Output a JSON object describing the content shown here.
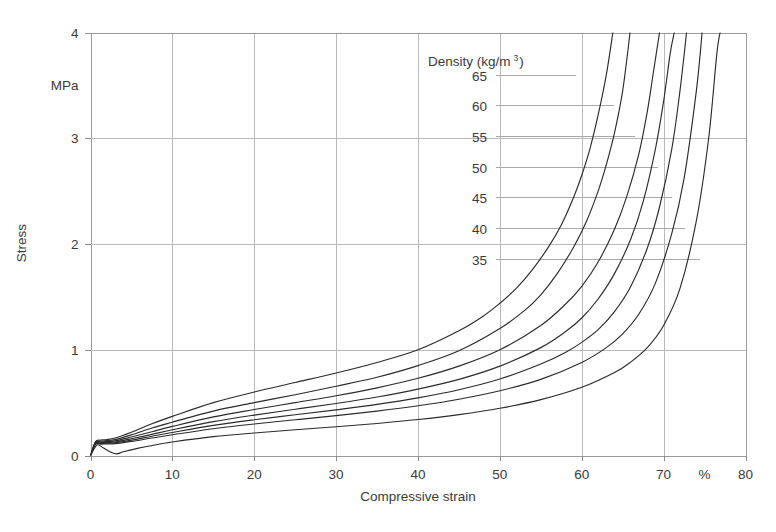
{
  "chart_data": {
    "type": "line",
    "title": "",
    "xlabel": "Compressive strain",
    "xunit": "%",
    "ylabel": "Stress",
    "yunit": "MPa",
    "xlim": [
      0,
      80
    ],
    "ylim": [
      0,
      4
    ],
    "xticks": [
      0,
      10,
      20,
      30,
      40,
      50,
      60,
      70,
      80
    ],
    "xticklabels": [
      "0",
      "10",
      "20",
      "30",
      "40",
      "50",
      "60",
      "70",
      "80"
    ],
    "yticks": [
      0,
      1,
      2,
      3,
      4
    ],
    "yticklabels": [
      "0",
      "1",
      "2",
      "3",
      "4"
    ],
    "grid": true,
    "legend_position": "inside-upper-center",
    "legend_title": "Density (kg/m",
    "legend_title_sup": "3",
    "legend_title_close": ")",
    "series": [
      {
        "name": "65",
        "label": "65",
        "points": [
          [
            0,
            0
          ],
          [
            0.6,
            0.13
          ],
          [
            1.2,
            0.145
          ],
          [
            2,
            0.15
          ],
          [
            3,
            0.165
          ],
          [
            5,
            0.22
          ],
          [
            7.5,
            0.3
          ],
          [
            10,
            0.37
          ],
          [
            15,
            0.5
          ],
          [
            20,
            0.6
          ],
          [
            25,
            0.69
          ],
          [
            30,
            0.78
          ],
          [
            35,
            0.88
          ],
          [
            40,
            1.0
          ],
          [
            45,
            1.18
          ],
          [
            48,
            1.32
          ],
          [
            50,
            1.44
          ],
          [
            52,
            1.58
          ],
          [
            54,
            1.76
          ],
          [
            56,
            1.98
          ],
          [
            57.5,
            2.18
          ],
          [
            59,
            2.44
          ],
          [
            60,
            2.65
          ],
          [
            61,
            2.9
          ],
          [
            62,
            3.22
          ],
          [
            63,
            3.6
          ],
          [
            63.8,
            4.0
          ]
        ]
      },
      {
        "name": "60",
        "label": "60",
        "points": [
          [
            0,
            0
          ],
          [
            0.6,
            0.125
          ],
          [
            1.2,
            0.135
          ],
          [
            2,
            0.14
          ],
          [
            3,
            0.15
          ],
          [
            5,
            0.195
          ],
          [
            7.5,
            0.26
          ],
          [
            10,
            0.315
          ],
          [
            15,
            0.42
          ],
          [
            20,
            0.5
          ],
          [
            25,
            0.575
          ],
          [
            30,
            0.655
          ],
          [
            35,
            0.74
          ],
          [
            40,
            0.85
          ],
          [
            45,
            0.99
          ],
          [
            50,
            1.2
          ],
          [
            53,
            1.37
          ],
          [
            55,
            1.52
          ],
          [
            57,
            1.72
          ],
          [
            59,
            1.97
          ],
          [
            60.5,
            2.2
          ],
          [
            62,
            2.5
          ],
          [
            63,
            2.75
          ],
          [
            64,
            3.05
          ],
          [
            65,
            3.45
          ],
          [
            65.9,
            4.0
          ]
        ]
      },
      {
        "name": "55",
        "label": "55",
        "points": [
          [
            0,
            0
          ],
          [
            0.6,
            0.12
          ],
          [
            1.2,
            0.128
          ],
          [
            2,
            0.132
          ],
          [
            3,
            0.138
          ],
          [
            5,
            0.175
          ],
          [
            7.5,
            0.225
          ],
          [
            10,
            0.275
          ],
          [
            15,
            0.365
          ],
          [
            20,
            0.435
          ],
          [
            25,
            0.5
          ],
          [
            30,
            0.565
          ],
          [
            35,
            0.64
          ],
          [
            40,
            0.73
          ],
          [
            45,
            0.845
          ],
          [
            50,
            1.0
          ],
          [
            55,
            1.23
          ],
          [
            58,
            1.43
          ],
          [
            60,
            1.6
          ],
          [
            62,
            1.83
          ],
          [
            64,
            2.14
          ],
          [
            65.5,
            2.45
          ],
          [
            67,
            2.86
          ],
          [
            68,
            3.25
          ],
          [
            68.8,
            3.65
          ],
          [
            69.5,
            4.0
          ]
        ]
      },
      {
        "name": "50",
        "label": "50",
        "points": [
          [
            0,
            0
          ],
          [
            0.6,
            0.115
          ],
          [
            1.2,
            0.12
          ],
          [
            2,
            0.124
          ],
          [
            3,
            0.128
          ],
          [
            5,
            0.158
          ],
          [
            7.5,
            0.2
          ],
          [
            10,
            0.243
          ],
          [
            15,
            0.32
          ],
          [
            20,
            0.382
          ],
          [
            25,
            0.437
          ],
          [
            30,
            0.492
          ],
          [
            35,
            0.553
          ],
          [
            40,
            0.628
          ],
          [
            45,
            0.72
          ],
          [
            50,
            0.845
          ],
          [
            55,
            1.02
          ],
          [
            58,
            1.17
          ],
          [
            60,
            1.3
          ],
          [
            62,
            1.48
          ],
          [
            64,
            1.72
          ],
          [
            66,
            2.05
          ],
          [
            67.5,
            2.4
          ],
          [
            69,
            2.9
          ],
          [
            70,
            3.35
          ],
          [
            70.8,
            3.8
          ],
          [
            71.3,
            4.0
          ]
        ]
      },
      {
        "name": "45",
        "label": "45",
        "points": [
          [
            0,
            0
          ],
          [
            0.6,
            0.11
          ],
          [
            1.2,
            0.114
          ],
          [
            2,
            0.117
          ],
          [
            3,
            0.12
          ],
          [
            5,
            0.145
          ],
          [
            7.5,
            0.182
          ],
          [
            10,
            0.218
          ],
          [
            15,
            0.285
          ],
          [
            20,
            0.338
          ],
          [
            25,
            0.385
          ],
          [
            30,
            0.432
          ],
          [
            35,
            0.483
          ],
          [
            40,
            0.545
          ],
          [
            45,
            0.622
          ],
          [
            50,
            0.723
          ],
          [
            55,
            0.865
          ],
          [
            58,
            0.975
          ],
          [
            60,
            1.07
          ],
          [
            62,
            1.19
          ],
          [
            64,
            1.36
          ],
          [
            66,
            1.6
          ],
          [
            68,
            1.96
          ],
          [
            69.5,
            2.35
          ],
          [
            71,
            2.9
          ],
          [
            72,
            3.45
          ],
          [
            72.8,
            4.0
          ]
        ]
      },
      {
        "name": "40",
        "label": "40",
        "points": [
          [
            0,
            0
          ],
          [
            0.6,
            0.105
          ],
          [
            1.2,
            0.108
          ],
          [
            2,
            0.11
          ],
          [
            3,
            0.112
          ],
          [
            5,
            0.133
          ],
          [
            7.5,
            0.165
          ],
          [
            10,
            0.196
          ],
          [
            15,
            0.253
          ],
          [
            20,
            0.298
          ],
          [
            25,
            0.338
          ],
          [
            30,
            0.377
          ],
          [
            35,
            0.42
          ],
          [
            40,
            0.47
          ],
          [
            45,
            0.532
          ],
          [
            50,
            0.612
          ],
          [
            55,
            0.72
          ],
          [
            60,
            0.88
          ],
          [
            63,
            1.02
          ],
          [
            65,
            1.15
          ],
          [
            67,
            1.34
          ],
          [
            69,
            1.63
          ],
          [
            71,
            2.1
          ],
          [
            72.5,
            2.62
          ],
          [
            74,
            3.45
          ],
          [
            74.7,
            4.0
          ]
        ]
      },
      {
        "name": "35",
        "label": "35",
        "points": [
          [
            0,
            0
          ],
          [
            0.8,
            0.1
          ],
          [
            1.6,
            0.07
          ],
          [
            2.4,
            0.035
          ],
          [
            3.2,
            0.015
          ],
          [
            4,
            0.035
          ],
          [
            6,
            0.072
          ],
          [
            8,
            0.102
          ],
          [
            10,
            0.128
          ],
          [
            15,
            0.178
          ],
          [
            20,
            0.213
          ],
          [
            25,
            0.243
          ],
          [
            30,
            0.272
          ],
          [
            35,
            0.303
          ],
          [
            40,
            0.34
          ],
          [
            45,
            0.387
          ],
          [
            50,
            0.447
          ],
          [
            55,
            0.528
          ],
          [
            60,
            0.645
          ],
          [
            64,
            0.785
          ],
          [
            66,
            0.885
          ],
          [
            68,
            1.02
          ],
          [
            70,
            1.23
          ],
          [
            72,
            1.58
          ],
          [
            74,
            2.22
          ],
          [
            75.5,
            3.0
          ],
          [
            76.5,
            3.8
          ],
          [
            76.9,
            4.0
          ]
        ]
      }
    ],
    "legend_entries": [
      {
        "label": "65",
        "leader_end_x": 59.3
      },
      {
        "label": "60",
        "leader_end_x": 63.9
      },
      {
        "label": "55",
        "leader_end_x": 66.5
      },
      {
        "label": "50",
        "leader_end_x": 69.3
      },
      {
        "label": "45",
        "leader_end_x": 71.0
      },
      {
        "label": "40",
        "leader_end_x": 72.6
      },
      {
        "label": "35",
        "leader_end_x": 74.4
      }
    ],
    "legend_value_rows_y": [
      3.6,
      3.31,
      3.02,
      2.73,
      2.44,
      2.15,
      1.86
    ],
    "colors": {
      "curve": "#2b2b2b",
      "grid": "#b9b9b9",
      "text": "#3a3a3a",
      "background": "#ffffff"
    }
  }
}
